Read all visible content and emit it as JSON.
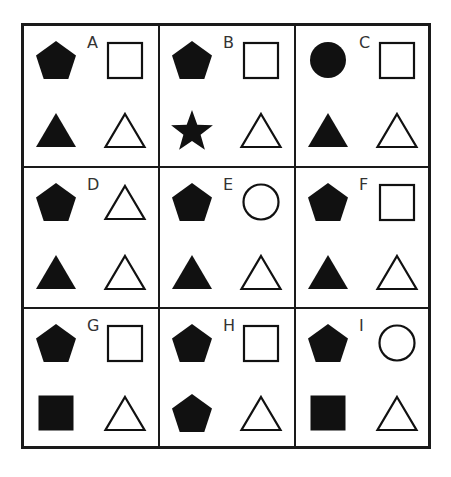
{
  "puzzle": {
    "colors": {
      "ink": "#111111",
      "background": "#ffffff"
    },
    "cells": [
      {
        "label": "A",
        "top_left": "pentagon-filled",
        "top_right": "square-outline",
        "bottom_left": "triangle-filled",
        "bottom_right": "triangle-outline"
      },
      {
        "label": "B",
        "top_left": "pentagon-filled",
        "top_right": "square-outline",
        "bottom_left": "star-filled",
        "bottom_right": "triangle-outline"
      },
      {
        "label": "C",
        "top_left": "circle-filled",
        "top_right": "square-outline",
        "bottom_left": "triangle-filled",
        "bottom_right": "triangle-outline"
      },
      {
        "label": "D",
        "top_left": "pentagon-filled",
        "top_right": "triangle-outline",
        "bottom_left": "triangle-filled",
        "bottom_right": "triangle-outline"
      },
      {
        "label": "E",
        "top_left": "pentagon-filled",
        "top_right": "circle-outline",
        "bottom_left": "triangle-filled",
        "bottom_right": "triangle-outline"
      },
      {
        "label": "F",
        "top_left": "pentagon-filled",
        "top_right": "square-outline",
        "bottom_left": "triangle-filled",
        "bottom_right": "triangle-outline"
      },
      {
        "label": "G",
        "top_left": "pentagon-filled",
        "top_right": "square-outline",
        "bottom_left": "square-filled",
        "bottom_right": "triangle-outline"
      },
      {
        "label": "H",
        "top_left": "pentagon-filled",
        "top_right": "square-outline",
        "bottom_left": "pentagon-filled",
        "bottom_right": "triangle-outline"
      },
      {
        "label": "I",
        "top_left": "pentagon-filled",
        "top_right": "circle-outline",
        "bottom_left": "square-filled",
        "bottom_right": "triangle-outline"
      }
    ]
  }
}
